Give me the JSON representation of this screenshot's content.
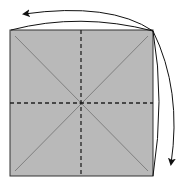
{
  "diagram": {
    "type": "origami-fold-step",
    "paper": {
      "x": 10,
      "y": 30,
      "width": 143,
      "height": 146,
      "fill": "#b9b9b9",
      "stroke": "#333333"
    },
    "creases": {
      "valley_folds": [
        {
          "name": "vertical-center",
          "x1": 81,
          "y1": 30,
          "x2": 81,
          "y2": 176
        },
        {
          "name": "horizontal-center",
          "x1": 10,
          "y1": 103,
          "x2": 153,
          "y2": 103
        }
      ],
      "mountain_folds": [
        {
          "name": "diagonal-1",
          "x1": 15,
          "y1": 36,
          "x2": 148,
          "y2": 171
        },
        {
          "name": "diagonal-2",
          "x1": 148,
          "y1": 36,
          "x2": 15,
          "y2": 171
        }
      ],
      "crease_color": "#808080",
      "dash_color": "#222222"
    },
    "arrows": [
      {
        "name": "fold-arrow-left",
        "from": "top-right-corner",
        "to": "left",
        "color": "#111111"
      },
      {
        "name": "fold-arrow-down",
        "from": "top-right-corner",
        "to": "bottom",
        "color": "#111111"
      }
    ]
  }
}
